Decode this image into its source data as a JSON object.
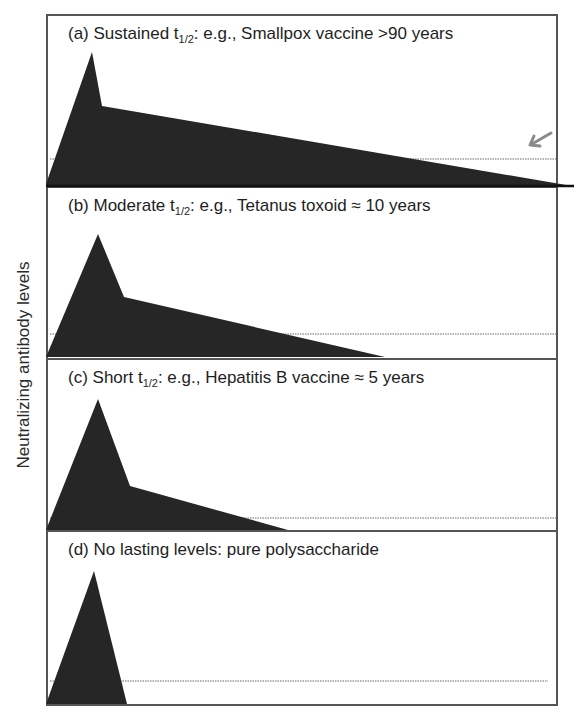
{
  "figure": {
    "y_axis_label": "Neutralizing antibody levels",
    "panels": [
      {
        "id": "a",
        "prefix": "(a) Sustained t",
        "subscript": "1/2",
        "suffix": ": e.g., Smallpox vaccine >90 years",
        "example": "Smallpox vaccine",
        "duration": ">90 years",
        "category": "Sustained"
      },
      {
        "id": "b",
        "prefix": "(b) Moderate t",
        "subscript": "1/2",
        "suffix": ": e.g., Tetanus toxoid ≈ 10 years",
        "example": "Tetanus toxoid",
        "duration": "≈ 10 years",
        "category": "Moderate"
      },
      {
        "id": "c",
        "prefix": "(c) Short t",
        "subscript": "1/2",
        "suffix": ": e.g., Hepatitis B vaccine ≈ 5 years",
        "example": "Hepatitis B vaccine",
        "duration": "≈ 5 years",
        "category": "Short"
      },
      {
        "id": "d",
        "prefix": "(d) No lasting levels: pure polysaccharide",
        "subscript": "",
        "suffix": "",
        "example": "pure polysaccharide",
        "duration": "",
        "category": "No lasting levels"
      }
    ],
    "colors": {
      "fill": "#262626",
      "border": "#555555",
      "dotted_threshold": "#9a9a9a",
      "arrow": "#8a8a8a"
    },
    "annotations": {
      "arrow_icon": "arrow-down-left-icon",
      "threshold_line": "dotted protective threshold"
    }
  }
}
